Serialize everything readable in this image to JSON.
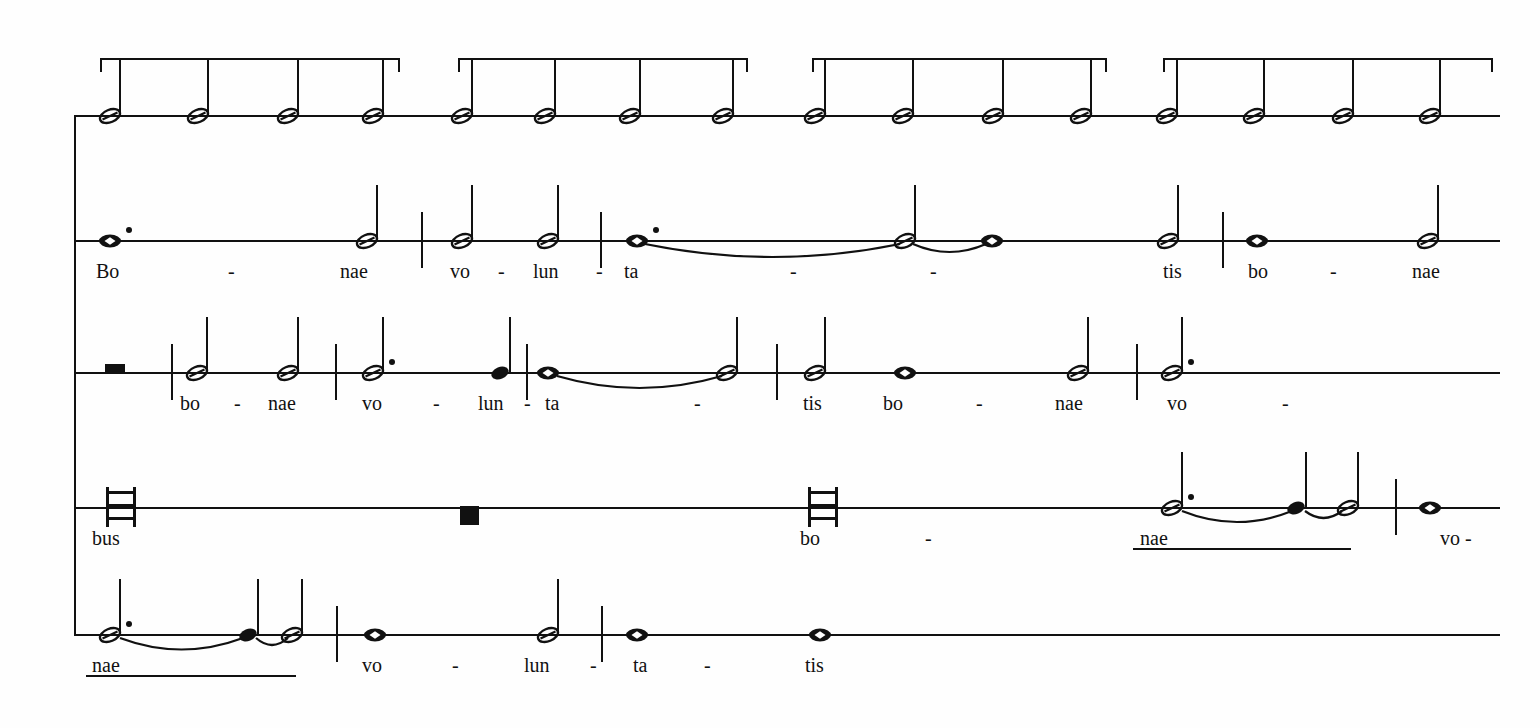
{
  "document": {
    "kind": "music-score",
    "notation_style": "white mensural notation",
    "staff_type": "single-line staff per voice",
    "voices": 5,
    "ink_color": "#111111",
    "paper_color": "#fefefe"
  },
  "system": {
    "left_bracket_x": 74,
    "right_edge_x": 1500,
    "staff_y": [
      115,
      240,
      372,
      507,
      634
    ]
  },
  "tempo_brackets": [
    {
      "x": 100,
      "width": 300,
      "label": ""
    },
    {
      "x": 458,
      "width": 290,
      "label": ""
    },
    {
      "x": 812,
      "width": 295,
      "label": ""
    },
    {
      "x": 1163,
      "width": 330,
      "label": ""
    }
  ],
  "staves": [
    {
      "index": 0,
      "name": "voice-1-tactus",
      "lyrics": [],
      "notes": [
        {
          "x": 110,
          "type": "half",
          "stem": "up"
        },
        {
          "x": 198,
          "type": "half",
          "stem": "up"
        },
        {
          "x": 288,
          "type": "half",
          "stem": "up"
        },
        {
          "x": 373,
          "type": "half",
          "stem": "up"
        },
        {
          "x": 462,
          "type": "half",
          "stem": "up"
        },
        {
          "x": 545,
          "type": "half",
          "stem": "up"
        },
        {
          "x": 630,
          "type": "half",
          "stem": "up"
        },
        {
          "x": 723,
          "type": "half",
          "stem": "up"
        },
        {
          "x": 815,
          "type": "half",
          "stem": "up"
        },
        {
          "x": 903,
          "type": "half",
          "stem": "up"
        },
        {
          "x": 993,
          "type": "half",
          "stem": "up"
        },
        {
          "x": 1081,
          "type": "half",
          "stem": "up"
        },
        {
          "x": 1167,
          "type": "half",
          "stem": "up"
        },
        {
          "x": 1254,
          "type": "half",
          "stem": "up"
        },
        {
          "x": 1343,
          "type": "half",
          "stem": "up"
        },
        {
          "x": 1430,
          "type": "half",
          "stem": "up"
        }
      ],
      "barlines": [],
      "slurs": [],
      "melismas": []
    },
    {
      "index": 1,
      "name": "voice-2",
      "lyrics": [
        {
          "x": 96,
          "text": "Bo"
        },
        {
          "x": 228,
          "text": "-"
        },
        {
          "x": 340,
          "text": "nae"
        },
        {
          "x": 450,
          "text": "vo"
        },
        {
          "x": 498,
          "text": "-"
        },
        {
          "x": 533,
          "text": "lun"
        },
        {
          "x": 596,
          "text": "-"
        },
        {
          "x": 624,
          "text": "ta"
        },
        {
          "x": 790,
          "text": "-"
        },
        {
          "x": 930,
          "text": "-"
        },
        {
          "x": 1163,
          "text": "tis"
        },
        {
          "x": 1248,
          "text": "bo"
        },
        {
          "x": 1330,
          "text": "-"
        },
        {
          "x": 1412,
          "text": "nae"
        }
      ],
      "notes": [
        {
          "x": 110,
          "type": "whole",
          "dotted": true
        },
        {
          "x": 367,
          "type": "half",
          "stem": "up"
        },
        {
          "x": 462,
          "type": "half",
          "stem": "up"
        },
        {
          "x": 548,
          "type": "half",
          "stem": "up"
        },
        {
          "x": 637,
          "type": "whole",
          "dotted": true
        },
        {
          "x": 905,
          "type": "half",
          "stem": "up"
        },
        {
          "x": 992,
          "type": "whole"
        },
        {
          "x": 1168,
          "type": "half",
          "stem": "up"
        },
        {
          "x": 1257,
          "type": "whole"
        },
        {
          "x": 1428,
          "type": "half",
          "stem": "up"
        }
      ],
      "barlines": [
        {
          "x": 421
        },
        {
          "x": 600
        },
        {
          "x": 1222
        }
      ],
      "slurs": [
        {
          "x1": 645,
          "x2": 900,
          "depth": 24
        },
        {
          "x1": 913,
          "x2": 986,
          "depth": 14
        }
      ],
      "melismas": []
    },
    {
      "index": 2,
      "name": "voice-3",
      "lyrics": [
        {
          "x": 180,
          "text": "bo"
        },
        {
          "x": 234,
          "text": "-"
        },
        {
          "x": 268,
          "text": "nae"
        },
        {
          "x": 362,
          "text": "vo"
        },
        {
          "x": 433,
          "text": "-"
        },
        {
          "x": 478,
          "text": "lun"
        },
        {
          "x": 524,
          "text": "-"
        },
        {
          "x": 545,
          "text": "ta"
        },
        {
          "x": 694,
          "text": "-"
        },
        {
          "x": 803,
          "text": "tis"
        },
        {
          "x": 883,
          "text": "bo"
        },
        {
          "x": 976,
          "text": "-"
        },
        {
          "x": 1055,
          "text": "nae"
        },
        {
          "x": 1167,
          "text": "vo"
        },
        {
          "x": 1282,
          "text": "-"
        }
      ],
      "notes": [
        {
          "x": 197,
          "type": "half",
          "stem": "up"
        },
        {
          "x": 288,
          "type": "half",
          "stem": "up"
        },
        {
          "x": 373,
          "type": "half",
          "stem": "up",
          "dotted": true
        },
        {
          "x": 500,
          "type": "quarter",
          "stem": "up"
        },
        {
          "x": 548,
          "type": "whole"
        },
        {
          "x": 727,
          "type": "half",
          "stem": "up"
        },
        {
          "x": 815,
          "type": "half",
          "stem": "up"
        },
        {
          "x": 905,
          "type": "whole"
        },
        {
          "x": 1078,
          "type": "half",
          "stem": "up"
        },
        {
          "x": 1172,
          "type": "half",
          "stem": "up",
          "dotted": true
        }
      ],
      "rests": [
        {
          "x": 105,
          "type": "semibreve-rest"
        }
      ],
      "barlines": [
        {
          "x": 171
        },
        {
          "x": 335
        },
        {
          "x": 526
        },
        {
          "x": 776
        },
        {
          "x": 1136
        }
      ],
      "slurs": [
        {
          "x1": 557,
          "x2": 722,
          "depth": 22
        }
      ],
      "melismas": []
    },
    {
      "index": 3,
      "name": "voice-4",
      "lyrics": [
        {
          "x": 92,
          "text": "bus"
        },
        {
          "x": 800,
          "text": "bo"
        },
        {
          "x": 925,
          "text": "-"
        },
        {
          "x": 1140,
          "text": "nae"
        },
        {
          "x": 1440,
          "text": "vo -"
        }
      ],
      "notes": [
        {
          "x": 1172,
          "type": "half",
          "stem": "up",
          "dotted": true
        },
        {
          "x": 1296,
          "type": "quarter",
          "stem": "up"
        },
        {
          "x": 1348,
          "type": "half",
          "stem": "up"
        },
        {
          "x": 1430,
          "type": "whole"
        }
      ],
      "rests": [
        {
          "x": 460,
          "type": "square-rest"
        }
      ],
      "longas": [
        {
          "x": 106
        },
        {
          "x": 808
        }
      ],
      "barlines": [
        {
          "x": 1395
        }
      ],
      "slurs": [
        {
          "x1": 1182,
          "x2": 1292,
          "depth": 20
        },
        {
          "x1": 1305,
          "x2": 1342,
          "depth": 12
        }
      ],
      "melismas": [
        {
          "x": 1133,
          "width": 218,
          "y_offset": 32
        }
      ]
    },
    {
      "index": 4,
      "name": "voice-5",
      "lyrics": [
        {
          "x": 92,
          "text": "nae"
        },
        {
          "x": 362,
          "text": "vo"
        },
        {
          "x": 452,
          "text": "-"
        },
        {
          "x": 524,
          "text": "lun"
        },
        {
          "x": 590,
          "text": "-"
        },
        {
          "x": 633,
          "text": "ta"
        },
        {
          "x": 704,
          "text": "-"
        },
        {
          "x": 805,
          "text": "tis"
        }
      ],
      "notes": [
        {
          "x": 110,
          "type": "half",
          "stem": "up",
          "dotted": true
        },
        {
          "x": 248,
          "type": "quarter",
          "stem": "up"
        },
        {
          "x": 292,
          "type": "half",
          "stem": "up"
        },
        {
          "x": 375,
          "type": "whole"
        },
        {
          "x": 548,
          "type": "half",
          "stem": "up"
        },
        {
          "x": 637,
          "type": "whole"
        },
        {
          "x": 820,
          "type": "whole"
        }
      ],
      "barlines": [
        {
          "x": 336
        },
        {
          "x": 601
        }
      ],
      "slurs": [
        {
          "x1": 120,
          "x2": 243,
          "depth": 21
        },
        {
          "x1": 256,
          "x2": 288,
          "depth": 12
        }
      ],
      "melismas": [
        {
          "x": 86,
          "width": 210,
          "y_offset": 32
        }
      ]
    }
  ]
}
